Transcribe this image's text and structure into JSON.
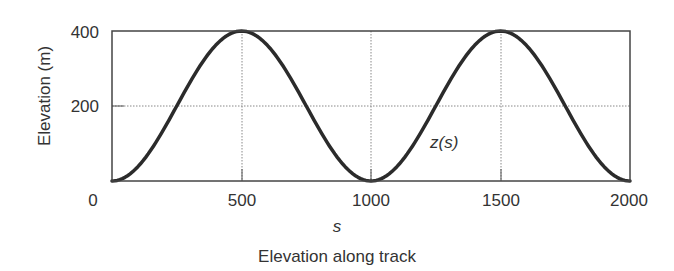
{
  "chart_data": {
    "type": "line",
    "title": "Elevation along track",
    "xlabel": "s",
    "ylabel": "Elevation (m)",
    "xlim": [
      0,
      2000
    ],
    "ylim": [
      0,
      400
    ],
    "x_ticks": [
      "0",
      "500",
      "1000",
      "1500",
      "2000"
    ],
    "y_ticks": [
      "200",
      "400"
    ],
    "grid": true,
    "series": [
      {
        "name": "z(s)",
        "x": [
          0,
          125,
          250,
          375,
          500,
          625,
          750,
          875,
          1000,
          1125,
          1250,
          1375,
          1500,
          1625,
          1750,
          1875,
          2000
        ],
        "y": [
          0,
          58.6,
          200,
          341.4,
          400,
          341.4,
          200,
          58.6,
          0,
          58.6,
          200,
          341.4,
          400,
          341.4,
          200,
          58.6,
          0
        ]
      }
    ],
    "annotations": [
      {
        "text": "z(s)",
        "x": 1250,
        "y": 110
      }
    ]
  },
  "labels": {
    "y_axis": "Elevation (m)",
    "x_axis": "s",
    "caption": "Elevation along track",
    "curve": "z(s)",
    "xt0": "0",
    "xt1": "500",
    "xt2": "1000",
    "xt3": "1500",
    "xt4": "2000",
    "yt200": "200",
    "yt400": "400"
  }
}
